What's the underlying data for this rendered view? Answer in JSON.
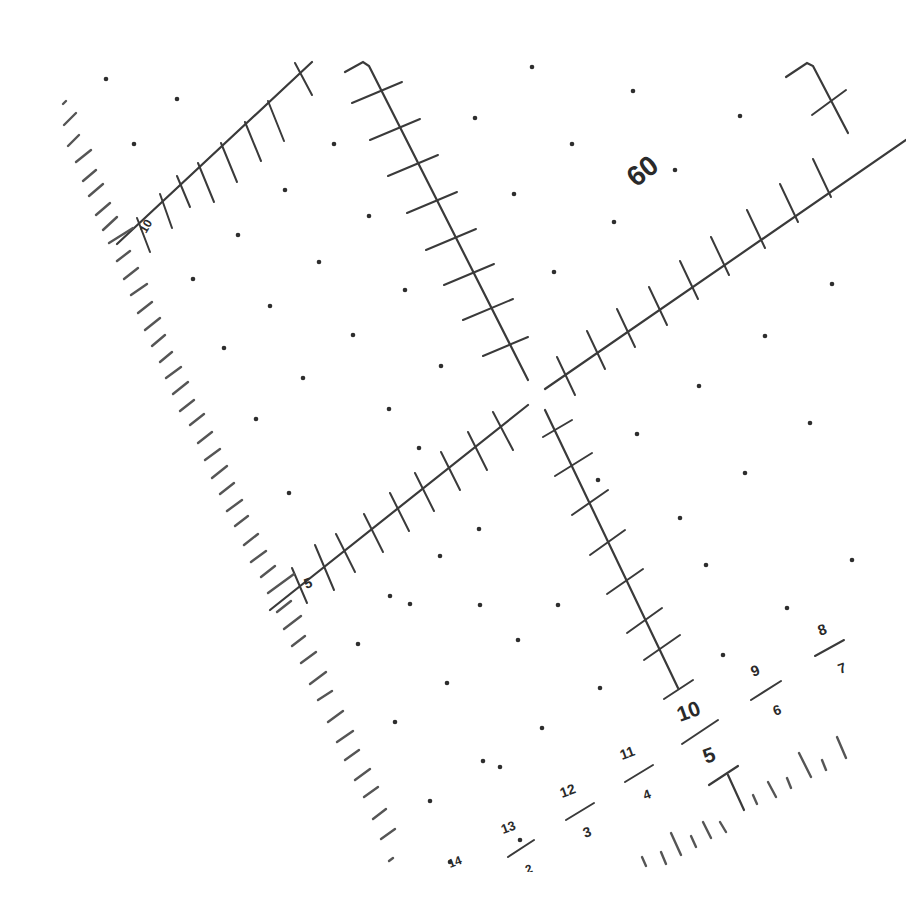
{
  "figure": {
    "type": "rotated reticle / protractor grid",
    "line_color": "#3a3a3a",
    "background": "#ffffff",
    "center": {
      "x": 537,
      "y": 390
    }
  },
  "labels": {
    "top_center": "60",
    "top_left_arm": "10",
    "left_arm": "5",
    "bottom_scale": [
      {
        "top": "8",
        "bottom": "7"
      },
      {
        "top": "9",
        "bottom": "6"
      },
      {
        "top": "10",
        "bottom": "5"
      },
      {
        "top": "11",
        "bottom": "4"
      },
      {
        "top": "12",
        "bottom": "3"
      },
      {
        "top": "13",
        "bottom": "2"
      },
      {
        "top": "14",
        "bottom": ""
      }
    ]
  }
}
